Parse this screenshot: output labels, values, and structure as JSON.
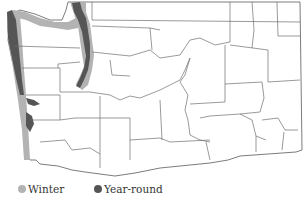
{
  "map": {
    "region": "Washington State counties",
    "colors": {
      "winter": "#b3b3b3",
      "year_round": "#555555",
      "county_border": "#6e6e6e",
      "background": "#ffffff"
    }
  },
  "legend": {
    "items": [
      {
        "label": "Winter",
        "color": "#b3b3b3"
      },
      {
        "label": "Year-round",
        "color": "#555555"
      }
    ]
  }
}
